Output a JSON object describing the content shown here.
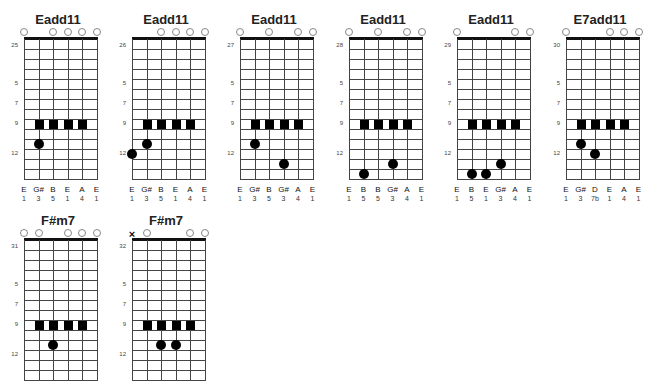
{
  "layout": {
    "string_spacing": 14.5,
    "fret_spacing": 10,
    "fret_count": 14,
    "fret_labels": [
      {
        "fret": 5,
        "label": "5"
      },
      {
        "fret": 7,
        "label": "7"
      },
      {
        "fret": 9,
        "label": "9"
      },
      {
        "fret": 12,
        "label": "12"
      }
    ]
  },
  "chords": [
    {
      "name": "Eadd11",
      "number": "25",
      "x": 0,
      "y": 12,
      "open": [
        0,
        2,
        3,
        4,
        5
      ],
      "muted": [],
      "squares": {
        "fret": 9,
        "strings": [
          1,
          2,
          3,
          4
        ]
      },
      "dots": [
        {
          "string": 1,
          "fret": 11
        }
      ],
      "notes": [
        "E",
        "G#",
        "B",
        "E",
        "A",
        "E"
      ],
      "intervals": [
        "1",
        "3",
        "5",
        "1",
        "4",
        "1"
      ]
    },
    {
      "name": "Eadd11",
      "number": "26",
      "x": 108,
      "y": 12,
      "open": [
        2,
        3,
        4,
        5
      ],
      "muted": [],
      "squares": {
        "fret": 9,
        "strings": [
          1,
          2,
          3,
          4
        ]
      },
      "dots": [
        {
          "string": 1,
          "fret": 11
        },
        {
          "string": 0,
          "fret": 12
        }
      ],
      "notes": [
        "E",
        "G#",
        "B",
        "E",
        "A",
        "E"
      ],
      "intervals": [
        "1",
        "3",
        "5",
        "1",
        "4",
        "1"
      ]
    },
    {
      "name": "Eadd11",
      "number": "27",
      "x": 216,
      "y": 12,
      "open": [
        0,
        2,
        4,
        5
      ],
      "muted": [],
      "squares": {
        "fret": 9,
        "strings": [
          1,
          2,
          3,
          4
        ]
      },
      "dots": [
        {
          "string": 1,
          "fret": 11
        },
        {
          "string": 3,
          "fret": 13
        }
      ],
      "notes": [
        "E",
        "G#",
        "B",
        "G#",
        "A",
        "E"
      ],
      "intervals": [
        "1",
        "3",
        "5",
        "3",
        "4",
        "1"
      ]
    },
    {
      "name": "Eadd11",
      "number": "28",
      "x": 325,
      "y": 12,
      "open": [
        0,
        2,
        4,
        5
      ],
      "muted": [],
      "squares": {
        "fret": 9,
        "strings": [
          1,
          2,
          3,
          4
        ]
      },
      "dots": [
        {
          "string": 1,
          "fret": 14
        },
        {
          "string": 3,
          "fret": 13
        }
      ],
      "notes": [
        "E",
        "B",
        "B",
        "G#",
        "A",
        "E"
      ],
      "intervals": [
        "1",
        "5",
        "5",
        "3",
        "4",
        "1"
      ]
    },
    {
      "name": "Eadd11",
      "number": "29",
      "x": 433,
      "y": 12,
      "open": [
        0,
        4,
        5
      ],
      "muted": [],
      "squares": {
        "fret": 9,
        "strings": [
          1,
          2,
          3,
          4
        ]
      },
      "dots": [
        {
          "string": 1,
          "fret": 14
        },
        {
          "string": 2,
          "fret": 14
        },
        {
          "string": 3,
          "fret": 13
        }
      ],
      "notes": [
        "E",
        "B",
        "E",
        "G#",
        "A",
        "E"
      ],
      "intervals": [
        "1",
        "5",
        "1",
        "3",
        "4",
        "1"
      ]
    },
    {
      "name": "E7add11",
      "number": "30",
      "x": 542,
      "y": 12,
      "open": [
        0,
        3,
        4,
        5
      ],
      "muted": [],
      "squares": {
        "fret": 9,
        "strings": [
          1,
          2,
          3,
          4
        ]
      },
      "dots": [
        {
          "string": 1,
          "fret": 11
        },
        {
          "string": 2,
          "fret": 12
        }
      ],
      "notes": [
        "E",
        "G#",
        "D",
        "E",
        "A",
        "E"
      ],
      "intervals": [
        "1",
        "3",
        "7b",
        "1",
        "4",
        "1"
      ]
    },
    {
      "name": "F#m7",
      "number": "31",
      "x": 0,
      "y": 213,
      "open": [
        0,
        1,
        3,
        4,
        5
      ],
      "muted": [],
      "squares": {
        "fret": 9,
        "strings": [
          1,
          2,
          3,
          4
        ]
      },
      "dots": [
        {
          "string": 2,
          "fret": 11
        }
      ],
      "notes": [],
      "intervals": []
    },
    {
      "name": "F#m7",
      "number": "32",
      "x": 108,
      "y": 213,
      "open": [
        1,
        4,
        5
      ],
      "muted": [
        0
      ],
      "squares": {
        "fret": 9,
        "strings": [
          1,
          2,
          3,
          4
        ]
      },
      "dots": [
        {
          "string": 2,
          "fret": 11
        },
        {
          "string": 3,
          "fret": 11
        }
      ],
      "notes": [],
      "intervals": []
    }
  ]
}
